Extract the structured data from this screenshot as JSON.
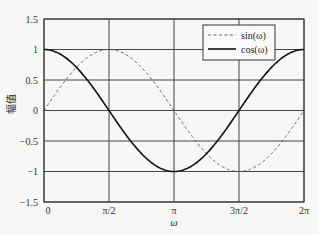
{
  "chart_data": {
    "type": "line",
    "title": "",
    "xlabel": "ω",
    "ylabel": "幅值",
    "xlim": [
      0,
      6.2832
    ],
    "ylim": [
      -1.5,
      1.5
    ],
    "grid": true,
    "legend_position": "upper right",
    "x_ticks": [
      {
        "value": 0,
        "label": "0"
      },
      {
        "value": 1.5708,
        "label": "π/2"
      },
      {
        "value": 3.1416,
        "label": "π"
      },
      {
        "value": 4.7124,
        "label": "3π/2"
      },
      {
        "value": 6.2832,
        "label": "2π"
      }
    ],
    "y_ticks": [
      {
        "value": 1.5,
        "label": "1.5"
      },
      {
        "value": 1,
        "label": "1"
      },
      {
        "value": 0.5,
        "label": "0.5"
      },
      {
        "value": 0,
        "label": "0"
      },
      {
        "value": -0.5,
        "label": "−0.5"
      },
      {
        "value": -1,
        "label": "−1"
      },
      {
        "value": -1.5,
        "label": "−1.5"
      }
    ],
    "x": [
      0,
      0.7854,
      1.5708,
      2.3562,
      3.1416,
      3.927,
      4.7124,
      5.4978,
      6.2832
    ],
    "series": [
      {
        "name": "sin(ω)",
        "style": "dashed",
        "color": "#555555",
        "values": [
          0,
          0.707,
          1,
          0.707,
          0,
          -0.707,
          -1,
          -0.707,
          0
        ],
        "fn": "sin"
      },
      {
        "name": "cos(ω)",
        "style": "solid",
        "color": "#111111",
        "values": [
          1,
          0.707,
          0,
          -0.707,
          -1,
          -0.707,
          0,
          0.707,
          1
        ],
        "fn": "cos"
      }
    ]
  },
  "layout": {
    "plot": {
      "left": 44,
      "top": 19,
      "right": 304,
      "bottom": 202
    },
    "legend": {
      "x": 203,
      "y": 25,
      "w": 72,
      "h": 35
    }
  }
}
